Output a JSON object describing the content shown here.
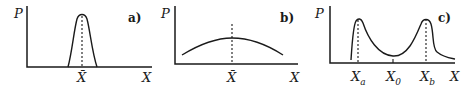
{
  "figure": {
    "panels": [
      {
        "id": "a",
        "tag": "a)",
        "y_label": "P",
        "x_label": "X",
        "marker_label": "X̄",
        "description": "narrow single peak at mean"
      },
      {
        "id": "b",
        "tag": "b)",
        "y_label": "P",
        "x_label": "X",
        "marker_label": "X̄",
        "description": "broad flat single peak at mean"
      },
      {
        "id": "c",
        "tag": "c)",
        "y_label": "P",
        "x_label": "X",
        "markers": [
          {
            "base": "X",
            "sub": "a"
          },
          {
            "base": "X",
            "sub": "0"
          },
          {
            "base": "X",
            "sub": "b"
          }
        ],
        "description": "bimodal distribution with peaks at Xa and Xb, minimum at X0"
      }
    ],
    "colors": {
      "ink": "#1a1a1a",
      "background": "#ffffff"
    }
  }
}
